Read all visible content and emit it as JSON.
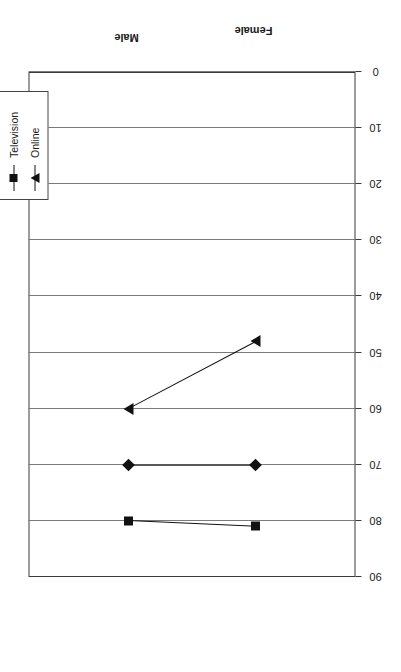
{
  "chart_data": {
    "type": "line",
    "title": "",
    "xlabel": "",
    "ylabel": "",
    "categories": [
      "Female",
      "Male"
    ],
    "series": [
      {
        "name": "Newspapers",
        "marker": "diamond",
        "values": [
          70,
          70
        ]
      },
      {
        "name": "Television",
        "marker": "square",
        "values": [
          81,
          80
        ]
      },
      {
        "name": "Online",
        "marker": "triangle",
        "values": [
          48,
          60
        ]
      }
    ],
    "ylim": [
      0,
      90
    ],
    "yticks": [
      90,
      80,
      70,
      60,
      50,
      40,
      30,
      20,
      10,
      0
    ],
    "ytick_labels": [
      "90",
      "80",
      "70",
      "60",
      "50",
      "40",
      "30",
      "20",
      "10",
      "0"
    ],
    "grid": true,
    "grid_axis": "value",
    "legend_position": "top-right",
    "orientation": "rotated-90",
    "line_color": "#111111",
    "frame_color": "#3a3a3a",
    "grid_color": "#7a7a7a"
  },
  "legend": {
    "items": [
      {
        "label": "Newspapers",
        "marker": "diamond-marker-icon"
      },
      {
        "label": "Television",
        "marker": "square-marker-icon"
      },
      {
        "label": "Online",
        "marker": "triangle-marker-icon"
      }
    ]
  },
  "axes": {
    "category_labels": [
      "Female",
      "Male"
    ],
    "value_labels": [
      "90",
      "80",
      "70",
      "60",
      "50",
      "40",
      "30",
      "20",
      "10",
      "0"
    ]
  }
}
